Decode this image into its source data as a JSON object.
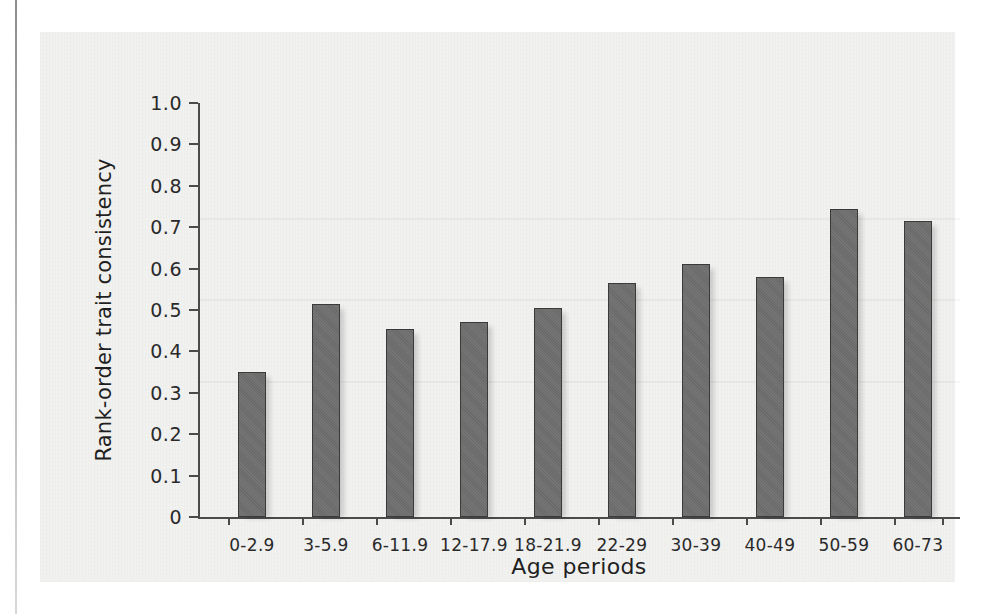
{
  "figure": {
    "background_color": "#f1f1f0",
    "page_color": "#ffffff"
  },
  "chart_data": {
    "type": "bar",
    "title": "",
    "xlabel": "Age periods",
    "ylabel": "Rank-order trait consistency",
    "categories": [
      "0-2.9",
      "3-5.9",
      "6-11.9",
      "12-17.9",
      "18-21.9",
      "22-29",
      "30-39",
      "40-49",
      "50-59",
      "60-73"
    ],
    "values": [
      0.35,
      0.515,
      0.455,
      0.47,
      0.505,
      0.565,
      0.61,
      0.58,
      0.745,
      0.715
    ],
    "series": [
      {
        "name": "Rank-order trait consistency",
        "values": [
          0.35,
          0.515,
          0.455,
          0.47,
          0.505,
          0.565,
          0.61,
          0.58,
          0.745,
          0.715
        ]
      }
    ],
    "ylim": [
      0,
      1.0
    ],
    "ytick_values": [
      1.0,
      0.9,
      0.8,
      0.7,
      0.6,
      0.5,
      0.4,
      0.3,
      0.2,
      0.1,
      0
    ],
    "ytick_labels": [
      "1.0",
      "0.9",
      "0.8",
      "0.7",
      "0.6",
      "0.5",
      "0.4",
      "0.3",
      "0.2",
      "0.1",
      "0"
    ],
    "grid": false,
    "legend": "none",
    "bar_color": "#6e6e6e",
    "bar_edge_color": "#3a3a3a"
  }
}
